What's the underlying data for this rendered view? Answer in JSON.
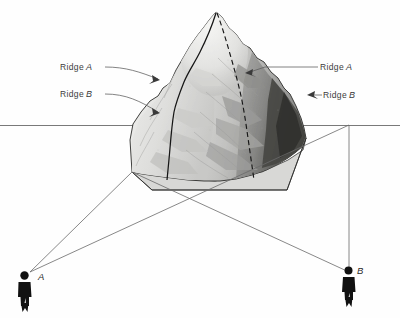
{
  "labels": {
    "ridge_a_left": {
      "text": "Ridge",
      "letter": "A"
    },
    "ridge_b_left": {
      "text": "Ridge",
      "letter": "B"
    },
    "ridge_a_right": {
      "text": "Ridge",
      "letter": "A"
    },
    "ridge_b_right": {
      "text": "Ridge",
      "letter": "B"
    }
  },
  "observers": {
    "left": {
      "label": "A"
    },
    "right": {
      "label": "B"
    }
  },
  "icons": {
    "observer_left": "person-silhouette-icon",
    "observer_right": "person-silhouette-icon",
    "arrow_ridge_a_left": "arrow-right-icon",
    "arrow_ridge_b_left": "arrow-right-icon",
    "arrow_ridge_b_right": "arrow-left-icon"
  },
  "colors": {
    "background": "#fefefe",
    "line": "#5a5a5a",
    "ridge_line": "#1c1c1c",
    "label_text": "#3b3b3b",
    "silhouette": "#111111",
    "mountain_light": "#e4e4e2",
    "mountain_mid": "#bdbdbb",
    "mountain_dark": "#6e6e6c",
    "mountain_shadow": "#3a3a38"
  }
}
